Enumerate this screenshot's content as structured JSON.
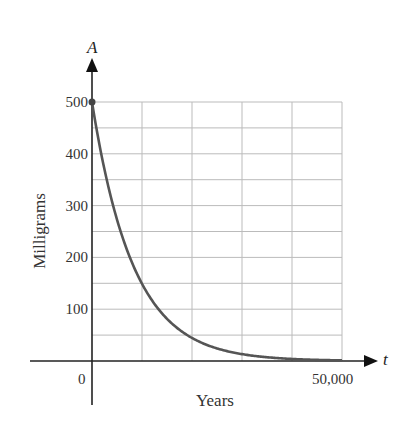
{
  "chart_data": {
    "type": "line",
    "title": "",
    "xlabel": "Years",
    "ylabel": "Milligrams",
    "x_axis_variable": "t",
    "y_axis_variable": "A",
    "xlim": [
      0,
      50000
    ],
    "ylim": [
      0,
      500
    ],
    "x_tick_labels": [
      "0",
      "50,000"
    ],
    "y_tick_labels": [
      "100",
      "200",
      "300",
      "400",
      "500"
    ],
    "y_ticks": [
      100,
      200,
      300,
      400,
      500
    ],
    "grid": true,
    "grid_x_step": 10000,
    "grid_y_step": 50,
    "series": [
      {
        "name": "A(t)",
        "color": "#555555",
        "x": [
          0,
          2500,
          5000,
          7500,
          10000,
          12500,
          15000,
          17500,
          20000,
          25000,
          30000,
          35000,
          40000,
          45000,
          50000
        ],
        "values": [
          500,
          369,
          273,
          202,
          149,
          110,
          81,
          60,
          45,
          24,
          13,
          7,
          4,
          2,
          1
        ]
      }
    ],
    "highlighted_points": [
      {
        "x": 0,
        "y": 500
      }
    ],
    "legend": null
  },
  "colors": {
    "axis": "#222222",
    "grid": "#bbbbbb",
    "curve": "#555555"
  }
}
